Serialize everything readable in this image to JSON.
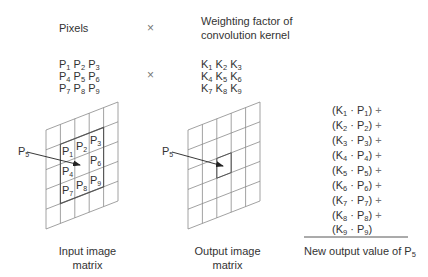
{
  "header": {
    "pixels_label": "Pixels",
    "times_symbol": "×",
    "kernel_label_line1": "Weighting factor of",
    "kernel_label_line2": "convolution kernel"
  },
  "pixel_matrix": {
    "rows": [
      [
        {
          "base": "P",
          "sub": "1"
        },
        {
          "base": "P",
          "sub": "2"
        },
        {
          "base": "P",
          "sub": "3"
        }
      ],
      [
        {
          "base": "P",
          "sub": "4"
        },
        {
          "base": "P",
          "sub": "5"
        },
        {
          "base": "P",
          "sub": "6"
        }
      ],
      [
        {
          "base": "P",
          "sub": "7"
        },
        {
          "base": "P",
          "sub": "8"
        },
        {
          "base": "P",
          "sub": "9"
        }
      ]
    ]
  },
  "kernel_matrix": {
    "rows": [
      [
        {
          "base": "K",
          "sub": "1"
        },
        {
          "base": "K",
          "sub": "2"
        },
        {
          "base": "K",
          "sub": "3"
        }
      ],
      [
        {
          "base": "K",
          "sub": "4"
        },
        {
          "base": "K",
          "sub": "5"
        },
        {
          "base": "K",
          "sub": "6"
        }
      ],
      [
        {
          "base": "K",
          "sub": "7"
        },
        {
          "base": "K",
          "sub": "8"
        },
        {
          "base": "K",
          "sub": "9"
        }
      ]
    ]
  },
  "input_grid": {
    "pointer_label": {
      "base": "P",
      "sub": "5"
    },
    "cells": [
      {
        "base": "P",
        "sub": "1"
      },
      {
        "base": "P",
        "sub": "2"
      },
      {
        "base": "P",
        "sub": "3"
      },
      {
        "base": "P",
        "sub": "4"
      },
      {
        "base": "P",
        "sub": "6"
      },
      {
        "base": "P",
        "sub": "7"
      },
      {
        "base": "P",
        "sub": "8"
      },
      {
        "base": "P",
        "sub": "9"
      }
    ],
    "caption_line1": "Input image",
    "caption_line2": "matrix"
  },
  "output_grid": {
    "pointer_label": {
      "base": "P",
      "sub": "5"
    },
    "caption_line1": "Output image",
    "caption_line2": "matrix"
  },
  "equation": {
    "terms": [
      {
        "k": "1",
        "p": "1",
        "plus": "+"
      },
      {
        "k": "2",
        "p": "2",
        "plus": "+"
      },
      {
        "k": "3",
        "p": "3",
        "plus": "+"
      },
      {
        "k": "4",
        "p": "4",
        "plus": "+"
      },
      {
        "k": "5",
        "p": "5",
        "plus": "+"
      },
      {
        "k": "6",
        "p": "6",
        "plus": "+"
      },
      {
        "k": "7",
        "p": "7",
        "plus": "+"
      },
      {
        "k": "8",
        "p": "8",
        "plus": "+"
      },
      {
        "k": "9",
        "p": "9",
        "plus": ""
      }
    ],
    "result_label": "New output value of P",
    "result_sub": "5"
  },
  "colors": {
    "grid_line": "#8a8a8a",
    "highlight_line": "#555555",
    "text": "#333333"
  }
}
